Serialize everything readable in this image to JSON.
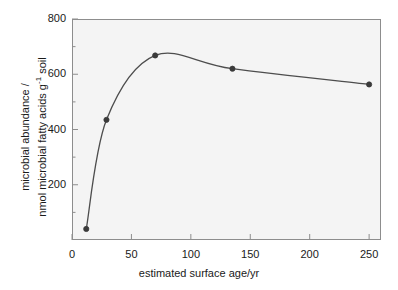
{
  "chart_data": {
    "type": "line",
    "title": "",
    "subtitle": "",
    "xlabel": "estimated surface age/yr",
    "ylabel_line1": "microbial abundance /",
    "ylabel_line2_prefix": "nmol microbial fatty acids g",
    "ylabel_line2_sup": "-1",
    "ylabel_line2_suffix": " soil",
    "x": [
      12,
      29,
      70,
      135,
      250
    ],
    "values": [
      40,
      435,
      668,
      620,
      563
    ],
    "series": [
      {
        "name": "microbial abundance",
        "x": [
          12,
          29,
          70,
          135,
          250
        ],
        "values": [
          40,
          435,
          668,
          620,
          563
        ]
      }
    ],
    "xlim": [
      0,
      260
    ],
    "ylim": [
      0,
      800
    ],
    "xticks": [
      0,
      50,
      100,
      150,
      200,
      250
    ],
    "xtick_labels": [
      "0",
      "50",
      "100",
      "150",
      "200",
      "250"
    ],
    "yticks": [
      200,
      400,
      600,
      800
    ],
    "ytick_labels": [
      "200",
      "400",
      "600",
      "800"
    ],
    "yminor_ticks": [
      100,
      300,
      500,
      700
    ],
    "grid": false,
    "legend": "none",
    "line_color": "#4d4d4d",
    "marker_color": "#3a3a3a",
    "marker_shape": "circle",
    "plot_background": "#f4f4f4",
    "frame_color": "#8d8d8d",
    "annotations": []
  },
  "figure": {
    "background": "#ffffff"
  }
}
